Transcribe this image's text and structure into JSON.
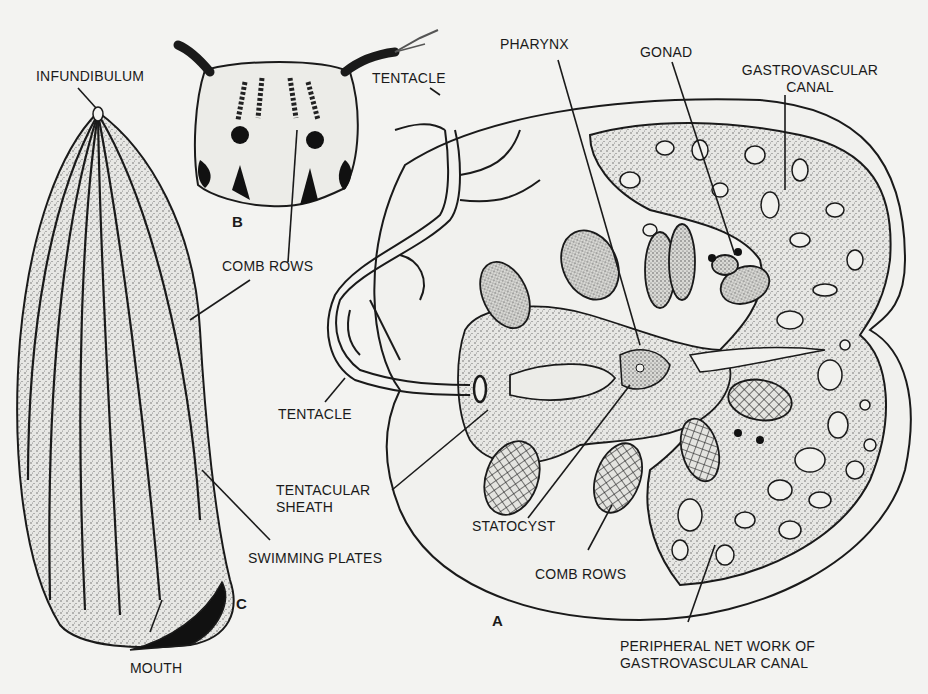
{
  "figure": {
    "type": "biological diagram",
    "panels": [
      {
        "id": "A",
        "label": "A"
      },
      {
        "id": "B",
        "label": "B"
      },
      {
        "id": "C",
        "label": "C"
      }
    ]
  },
  "labels": {
    "infundibulum": "INFUNDIBULUM",
    "tentacle_top": "TENTACLE",
    "pharynx": "PHARYNX",
    "gonad": "GONAD",
    "gastrovascular_canal_line1": "GASTROVASCULAR",
    "gastrovascular_canal_line2": "CANAL",
    "comb_rows_upper": "COMB ROWS",
    "tentacle_left": "TENTACLE",
    "tentacular_sheath_line1": "TENTACULAR",
    "tentacular_sheath_line2": "SHEATH",
    "statocyst": "STATOCYST",
    "swimming_plates": "SWIMMING PLATES",
    "comb_rows_lower": "COMB ROWS",
    "mouth": "MOUTH",
    "peripheral_line1": "PERIPHERAL NET WORK OF",
    "peripheral_line2": "GASTROVASCULAR  CANAL"
  },
  "colors": {
    "paper": "#f3f3f1",
    "ink": "#1a1a1a",
    "stipple": "#8a8a86"
  }
}
